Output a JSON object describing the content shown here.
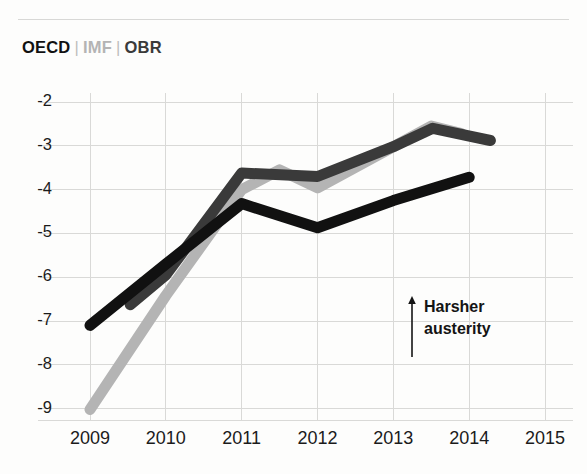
{
  "legend": {
    "items": [
      {
        "label": "OECD",
        "color": "#111111",
        "key": "oecd"
      },
      {
        "label": "IMF",
        "color": "#b4b4b4",
        "key": "imf"
      },
      {
        "label": "OBR",
        "color": "#3a3a3a",
        "key": "obr"
      }
    ],
    "separator": "|"
  },
  "annotation": {
    "arrow_icon": "up-arrow-icon",
    "line1": "Harsher",
    "line2": "austerity"
  },
  "chart_data": {
    "type": "line",
    "title": "",
    "subtitle": "",
    "xlabel": "",
    "ylabel": "",
    "xlim": [
      2009,
      2015
    ],
    "ylim": [
      -9.5,
      -1.8
    ],
    "grid": true,
    "legend_position": "top-left",
    "x_ticks": [
      "2009",
      "2010",
      "2011",
      "2012",
      "2013",
      "2014",
      "2015"
    ],
    "y_ticks": [
      "-2",
      "-3",
      "-4",
      "-5",
      "-6",
      "-7",
      "-8",
      "-9"
    ],
    "y_tick_values": [
      -2,
      -3,
      -4,
      -5,
      -6,
      -7,
      -8,
      -9
    ],
    "units": "% of GDP (cyclically adjusted balance)",
    "series": [
      {
        "name": "OECD",
        "color": "#111111",
        "stroke_width": 11,
        "points": [
          {
            "x": 2009.0,
            "y": -7.1
          },
          {
            "x": 2010.0,
            "y": -5.7
          },
          {
            "x": 2011.0,
            "y": -4.32
          },
          {
            "x": 2012.0,
            "y": -4.87
          },
          {
            "x": 2013.0,
            "y": -4.25
          },
          {
            "x": 2014.0,
            "y": -3.72
          }
        ]
      },
      {
        "name": "IMF",
        "color": "#b4b4b4",
        "stroke_width": 11,
        "points": [
          {
            "x": 2009.0,
            "y": -9.02
          },
          {
            "x": 2010.0,
            "y": -6.42
          },
          {
            "x": 2011.0,
            "y": -4.0
          },
          {
            "x": 2011.5,
            "y": -3.55
          },
          {
            "x": 2012.0,
            "y": -3.96
          },
          {
            "x": 2013.5,
            "y": -2.55
          },
          {
            "x": 2013.9,
            "y": -2.72
          }
        ]
      },
      {
        "name": "OBR",
        "color": "#3a3a3a",
        "stroke_width": 11,
        "points": [
          {
            "x": 2009.53,
            "y": -6.63
          },
          {
            "x": 2010.0,
            "y": -5.95
          },
          {
            "x": 2011.0,
            "y": -3.62
          },
          {
            "x": 2012.0,
            "y": -3.7
          },
          {
            "x": 2013.0,
            "y": -3.02
          },
          {
            "x": 2013.52,
            "y": -2.6
          },
          {
            "x": 2014.28,
            "y": -2.88
          }
        ]
      }
    ]
  }
}
